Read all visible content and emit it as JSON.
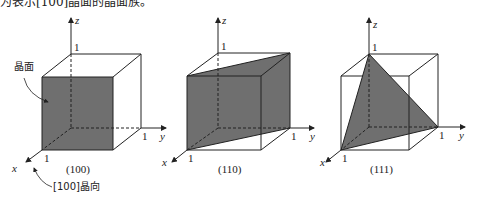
{
  "header": {
    "partial_text": "为表示[100]晶面的晶面族。"
  },
  "colors": {
    "plane_fill": "#6f6f6f",
    "line": "#222222"
  },
  "axes": {
    "x": "x",
    "y": "y",
    "z": "z",
    "unit": "1"
  },
  "figures": [
    {
      "caption": "(100)",
      "annotations": {
        "plane_label": "晶面",
        "direction_label": "[100]晶向"
      }
    },
    {
      "caption": "(110)"
    },
    {
      "caption": "(111)"
    }
  ]
}
